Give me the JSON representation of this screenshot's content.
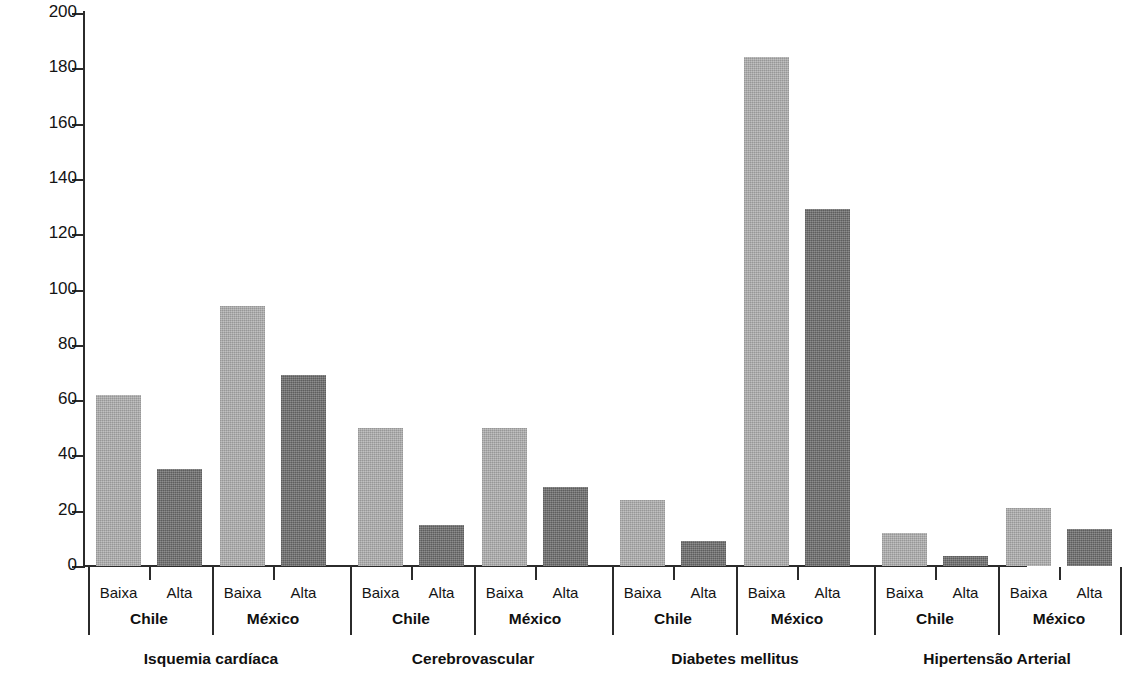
{
  "chart_data": {
    "type": "bar",
    "title": "",
    "subtitle": "",
    "xlabel": "",
    "ylabel": "Taxa padronizada por idade (por 100,000)",
    "ylim": [
      0,
      200
    ],
    "ytick_labels": [
      "200",
      "180",
      "160",
      "140",
      "120",
      "100",
      "80",
      "60",
      "40",
      "20",
      "0"
    ],
    "yticks": [
      200,
      180,
      160,
      140,
      120,
      100,
      80,
      60,
      40,
      20,
      0
    ],
    "grid": false,
    "legend": null,
    "legend_position": "none",
    "group_level_names": [
      "disease",
      "country",
      "education"
    ],
    "education_levels": [
      "Baixa",
      "Alta"
    ],
    "countries": [
      "Chile",
      "México"
    ],
    "diseases": [
      "Isquemia cardíaca",
      "Cerebrovascular",
      "Diabetes mellitus",
      "Hipertensão Arterial"
    ],
    "series": [
      {
        "name": "Baixa",
        "color": "#a9a9a9",
        "values": [
          62,
          94,
          50,
          50,
          24,
          184,
          12,
          21
        ]
      },
      {
        "name": "Alta",
        "color": "#6d6d6d",
        "values": [
          35,
          69,
          15,
          28.5,
          9,
          129,
          3.5,
          13.5
        ]
      }
    ],
    "categories": [
      "Isquemia cardíaca / Chile",
      "Isquemia cardíaca / México",
      "Cerebrovascular / Chile",
      "Cerebrovascular / México",
      "Diabetes mellitus / Chile",
      "Diabetes mellitus / México",
      "Hipertensão Arterial / Chile",
      "Hipertensão Arterial / México"
    ],
    "bars": [
      {
        "disease": "Isquemia cardíaca",
        "country": "Chile",
        "education": "Baixa",
        "value": 62,
        "color": "#a9a9a9"
      },
      {
        "disease": "Isquemia cardíaca",
        "country": "Chile",
        "education": "Alta",
        "value": 35,
        "color": "#6d6d6d"
      },
      {
        "disease": "Isquemia cardíaca",
        "country": "México",
        "education": "Baixa",
        "value": 94,
        "color": "#a9a9a9"
      },
      {
        "disease": "Isquemia cardíaca",
        "country": "México",
        "education": "Alta",
        "value": 69,
        "color": "#6d6d6d"
      },
      {
        "disease": "Cerebrovascular",
        "country": "Chile",
        "education": "Baixa",
        "value": 50,
        "color": "#a9a9a9"
      },
      {
        "disease": "Cerebrovascular",
        "country": "Chile",
        "education": "Alta",
        "value": 15,
        "color": "#6d6d6d"
      },
      {
        "disease": "Cerebrovascular",
        "country": "México",
        "education": "Baixa",
        "value": 50,
        "color": "#a9a9a9"
      },
      {
        "disease": "Cerebrovascular",
        "country": "México",
        "education": "Alta",
        "value": 28.5,
        "color": "#6d6d6d"
      },
      {
        "disease": "Diabetes mellitus",
        "country": "Chile",
        "education": "Baixa",
        "value": 24,
        "color": "#a9a9a9"
      },
      {
        "disease": "Diabetes mellitus",
        "country": "Chile",
        "education": "Alta",
        "value": 9,
        "color": "#6d6d6d"
      },
      {
        "disease": "Diabetes mellitus",
        "country": "México",
        "education": "Baixa",
        "value": 184,
        "color": "#a9a9a9"
      },
      {
        "disease": "Diabetes mellitus",
        "country": "México",
        "education": "Alta",
        "value": 129,
        "color": "#6d6d6d"
      },
      {
        "disease": "Hipertensão Arterial",
        "country": "Chile",
        "education": "Baixa",
        "value": 12,
        "color": "#a9a9a9"
      },
      {
        "disease": "Hipertensão Arterial",
        "country": "Chile",
        "education": "Alta",
        "value": 3.5,
        "color": "#6d6d6d"
      },
      {
        "disease": "Hipertensão Arterial",
        "country": "México",
        "education": "Baixa",
        "value": 21,
        "color": "#a9a9a9"
      },
      {
        "disease": "Hipertensão Arterial",
        "country": "México",
        "education": "Alta",
        "value": 13.5,
        "color": "#6d6d6d"
      }
    ]
  },
  "colors": {
    "low_education_bar": "#a9a9a9",
    "high_education_bar": "#6d6d6d",
    "axis": "#2b2b2b",
    "text": "#141414",
    "background": "#ffffff"
  }
}
